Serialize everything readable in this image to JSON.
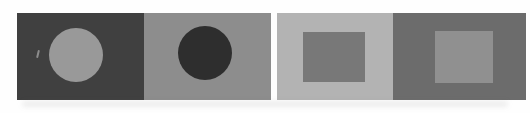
{
  "figure": {
    "page_background": "#fefefe",
    "panels": [
      {
        "id": "panel-1",
        "background": "#404040",
        "shape": "circle",
        "shape_color": "#999999"
      },
      {
        "id": "panel-2",
        "background": "#8d8d8d",
        "shape": "circle",
        "shape_color": "#2e2e2e"
      },
      {
        "id": "panel-3",
        "background": "#b3b3b3",
        "shape": "square",
        "shape_color": "#787878"
      },
      {
        "id": "panel-4",
        "background": "#6c6c6c",
        "shape": "square",
        "shape_color": "#909090"
      }
    ],
    "artifacts": {
      "scratch_color": "#9a9a9a",
      "shadow_color": "rgba(90,90,90,0.10)"
    }
  }
}
